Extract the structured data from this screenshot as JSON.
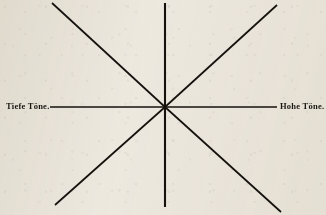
{
  "figure": {
    "type": "radial-ray-diagram",
    "background_color": "#efebe3",
    "ink_color": "#15120e",
    "center": {
      "x": 165,
      "y": 107
    },
    "labels": {
      "left_axis": "Tiefe Töne.",
      "right_axis": "Hohe Töne."
    },
    "caption": "",
    "rays": [
      {
        "name": "ray-up",
        "angle_deg": 90,
        "x1": 165,
        "y1": 107,
        "x2": 165,
        "y2": 3,
        "width": 2.1
      },
      {
        "name": "ray-down",
        "angle_deg": 270,
        "x1": 165,
        "y1": 107,
        "x2": 165,
        "y2": 207,
        "width": 2.1
      },
      {
        "name": "ray-left",
        "angle_deg": 180,
        "x1": 165,
        "y1": 107,
        "x2": 50,
        "y2": 107,
        "width": 1.5
      },
      {
        "name": "ray-right",
        "angle_deg": 0,
        "x1": 165,
        "y1": 107,
        "x2": 277,
        "y2": 107,
        "width": 1.5
      },
      {
        "name": "ray-upper-left",
        "angle_deg": 135,
        "x1": 165,
        "y1": 107,
        "x2": 52,
        "y2": 3,
        "width": 1.7
      },
      {
        "name": "ray-upper-right",
        "angle_deg": 45,
        "x1": 165,
        "y1": 107,
        "x2": 277,
        "y2": 5,
        "width": 1.7
      },
      {
        "name": "ray-lower-left",
        "angle_deg": 225,
        "x1": 165,
        "y1": 107,
        "x2": 55,
        "y2": 205,
        "width": 1.7
      },
      {
        "name": "ray-lower-right",
        "angle_deg": 315,
        "x1": 165,
        "y1": 107,
        "x2": 281,
        "y2": 212,
        "width": 1.7
      }
    ]
  }
}
